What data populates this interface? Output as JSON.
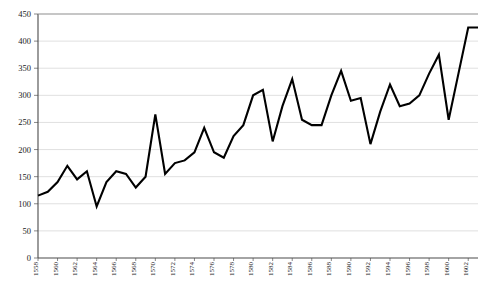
{
  "chart_data": {
    "type": "line",
    "title": "",
    "subtitle": "",
    "xlabel": "",
    "ylabel": "",
    "grid": true,
    "legend": false,
    "legend_position": "none",
    "ylim": [
      0,
      450
    ],
    "ytick_step": 50,
    "ytick_labels": [
      "0",
      "50",
      "100",
      "150",
      "200",
      "250",
      "300",
      "350",
      "400",
      "450"
    ],
    "ytick_values": [
      0,
      50,
      100,
      150,
      200,
      250,
      300,
      350,
      400,
      450
    ],
    "xlim": [
      1558,
      1603
    ],
    "xtick_labels": [
      "1558",
      "1560",
      "1562",
      "1564",
      "1566",
      "1568",
      "1570",
      "1572",
      "1574",
      "1576",
      "1578",
      "1580",
      "1582",
      "1584",
      "1586",
      "1588",
      "1590",
      "1592",
      "1594",
      "1596",
      "1598",
      "1600",
      "1602"
    ],
    "xtick_values": [
      1558,
      1560,
      1562,
      1564,
      1566,
      1568,
      1570,
      1572,
      1574,
      1576,
      1578,
      1580,
      1582,
      1584,
      1586,
      1588,
      1590,
      1592,
      1594,
      1596,
      1598,
      1600,
      1602
    ],
    "x": [
      1558,
      1559,
      1560,
      1561,
      1562,
      1563,
      1564,
      1565,
      1566,
      1567,
      1568,
      1569,
      1570,
      1571,
      1572,
      1573,
      1574,
      1575,
      1576,
      1577,
      1578,
      1579,
      1580,
      1581,
      1582,
      1583,
      1584,
      1585,
      1586,
      1587,
      1588,
      1589,
      1590,
      1591,
      1592,
      1593,
      1594,
      1595,
      1596,
      1597,
      1598,
      1599,
      1600,
      1601,
      1602,
      1603
    ],
    "series": [
      {
        "name": "series-1",
        "color": "#000000",
        "values": [
          115,
          122,
          140,
          170,
          145,
          160,
          95,
          140,
          160,
          155,
          130,
          150,
          265,
          155,
          175,
          180,
          195,
          240,
          195,
          185,
          225,
          245,
          300,
          310,
          215,
          280,
          330,
          255,
          245,
          245,
          300,
          345,
          290,
          295,
          210,
          270,
          320,
          280,
          285,
          300,
          340,
          375,
          255,
          340,
          425,
          425
        ]
      }
    ],
    "axis_color": "#4a4a4a",
    "grid_color": "#d2d2d2",
    "line_color": "#000000",
    "background": "#ffffff"
  }
}
